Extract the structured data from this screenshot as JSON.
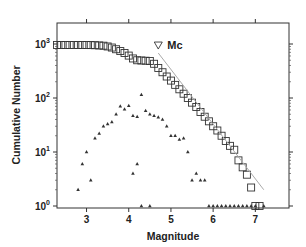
{
  "chart_data": {
    "type": "scatter",
    "title": "",
    "xlabel": "Magnitude",
    "ylabel": "Cumulative Number",
    "xlim": [
      2.3,
      7.8
    ],
    "ylim": [
      0.9,
      1500
    ],
    "yscale": "log",
    "grid": false,
    "legend": null,
    "xticks": [
      3,
      4,
      5,
      6,
      7
    ],
    "xtick_labels": [
      "3",
      "4",
      "5",
      "6",
      "7"
    ],
    "yticks": [
      1,
      10,
      100,
      1000
    ],
    "ytick_labels": [
      {
        "base": "10",
        "exp": "0"
      },
      {
        "base": "10",
        "exp": "1"
      },
      {
        "base": "10",
        "exp": "2"
      },
      {
        "base": "10",
        "exp": "3"
      }
    ],
    "annotations": [
      {
        "text": "Mc",
        "marker": "inverted-triangle",
        "x": 4.7,
        "y": 680
      }
    ],
    "series": [
      {
        "name": "Cumulative number",
        "marker": "open-square",
        "color": "#333333",
        "x": [
          2.3,
          2.4,
          2.5,
          2.6,
          2.7,
          2.8,
          2.9,
          3.0,
          3.1,
          3.2,
          3.3,
          3.4,
          3.5,
          3.6,
          3.7,
          3.8,
          3.9,
          4.0,
          4.1,
          4.2,
          4.3,
          4.4,
          4.5,
          4.6,
          4.7,
          4.8,
          4.9,
          5.0,
          5.1,
          5.2,
          5.3,
          5.4,
          5.5,
          5.6,
          5.7,
          5.8,
          5.9,
          6.0,
          6.1,
          6.2,
          6.3,
          6.4,
          6.5,
          6.6,
          6.7,
          6.8,
          6.9,
          7.0,
          7.1
        ],
        "y": [
          960,
          960,
          960,
          960,
          960,
          960,
          960,
          960,
          955,
          950,
          940,
          930,
          900,
          860,
          800,
          740,
          680,
          610,
          540,
          500,
          495,
          490,
          485,
          430,
          360,
          300,
          250,
          210,
          175,
          145,
          120,
          100,
          82,
          68,
          55,
          45,
          37,
          30,
          25,
          20,
          16,
          13,
          11,
          7,
          5.2,
          3.8,
          2.2,
          1,
          1
        ]
      },
      {
        "name": "Non-cumulative number",
        "marker": "filled-triangle",
        "color": "#333333",
        "x": [
          2.8,
          2.9,
          3.0,
          3.1,
          3.2,
          3.3,
          3.4,
          3.5,
          3.6,
          3.7,
          3.8,
          3.9,
          4.0,
          4.1,
          4.2,
          4.3,
          4.4,
          4.5,
          4.6,
          4.7,
          4.8,
          4.9,
          5.0,
          5.1,
          5.2,
          5.3,
          5.4,
          5.5,
          5.6,
          5.7,
          5.8,
          5.9,
          6.0,
          6.1,
          6.2,
          6.3,
          6.4,
          6.5,
          6.6,
          6.7,
          6.8,
          6.9,
          7.0,
          7.2,
          4.1,
          4.2,
          4.3,
          4.5
        ],
        "y": [
          2,
          6,
          10,
          3,
          18,
          22,
          30,
          33,
          36,
          50,
          70,
          62,
          72,
          47,
          45,
          115,
          58,
          50,
          47,
          44,
          40,
          30,
          20,
          20,
          17,
          18,
          10,
          3,
          4,
          3,
          3,
          1,
          1,
          1,
          1,
          1,
          1,
          1,
          1,
          1,
          1,
          1,
          1,
          1,
          4,
          6,
          1,
          1
        ]
      },
      {
        "name": "Gutenberg-Richter fit",
        "type": "line",
        "color": "#aaaaaa",
        "x": [
          4.7,
          7.2
        ],
        "y": [
          680,
          2.0
        ]
      }
    ]
  }
}
